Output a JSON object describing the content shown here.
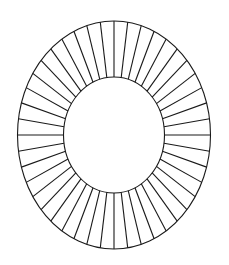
{
  "diagram": {
    "type": "spoked-elliptical-ring",
    "center": {
      "x": 114,
      "y": 135
    },
    "outer_ellipse": {
      "rx": 96.5,
      "ry": 114
    },
    "inner_ellipse": {
      "rx": 50.5,
      "ry": 58
    },
    "spoke_count": 44,
    "stroke_color": "#1a1a1a",
    "stroke_width": 1.1,
    "background": "#ffffff"
  }
}
